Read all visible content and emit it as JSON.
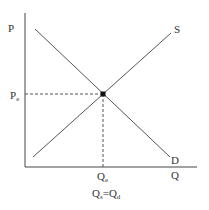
{
  "diagram": {
    "type": "supply-demand",
    "axes": {
      "y_label": "P",
      "x_label": "Q"
    },
    "curves": [
      {
        "name": "S",
        "label": "S",
        "kind": "supply",
        "from": [
          33,
          157
        ],
        "to": [
          171,
          33
        ]
      },
      {
        "name": "D",
        "label": "D",
        "kind": "demand",
        "from": [
          35,
          29
        ],
        "to": [
          170,
          157
        ]
      }
    ],
    "equilibrium": {
      "price_label_main": "P",
      "price_label_sub": "e",
      "quantity_label_main": "Q",
      "quantity_label_sub": "e",
      "point": [
        103,
        94
      ]
    },
    "condition": {
      "left_main": "Q",
      "left_sub": "s",
      "equals": "=",
      "right_main": "Q",
      "right_sub": "d"
    },
    "colors": {
      "line": "#555555",
      "axis": "#444444",
      "text": "#333333",
      "point": "#111111"
    }
  }
}
